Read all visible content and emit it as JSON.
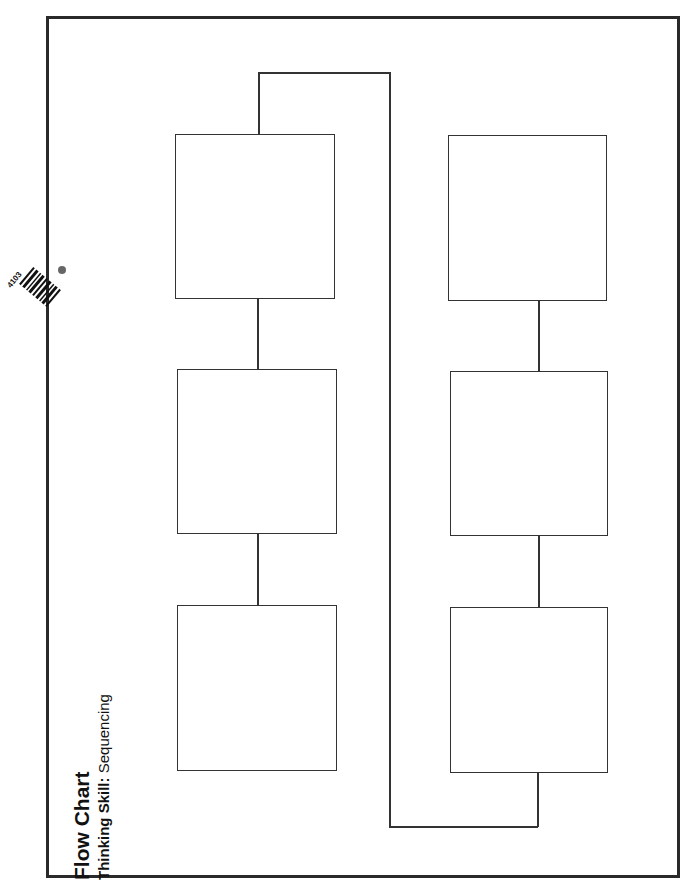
{
  "title": "Flow Chart",
  "subtitle": {
    "label": "Thinking Skill:",
    "value": "Sequencing"
  },
  "badge": {
    "code": "4103",
    "icon": "barcode-icon"
  },
  "diagram": {
    "type": "flow-chart",
    "boxes": [
      {
        "id": "box-1",
        "column": "left",
        "row": 1,
        "text": ""
      },
      {
        "id": "box-2",
        "column": "left",
        "row": 2,
        "text": ""
      },
      {
        "id": "box-3",
        "column": "left",
        "row": 3,
        "text": ""
      },
      {
        "id": "box-4",
        "column": "right",
        "row": 1,
        "text": ""
      },
      {
        "id": "box-5",
        "column": "right",
        "row": 2,
        "text": ""
      },
      {
        "id": "box-6",
        "column": "right",
        "row": 3,
        "text": ""
      }
    ],
    "connections": [
      [
        "box-1",
        "box-2"
      ],
      [
        "box-2",
        "box-3"
      ],
      [
        "box-1",
        "box-6"
      ],
      [
        "box-6",
        "box-5"
      ],
      [
        "box-5",
        "box-4"
      ]
    ]
  }
}
